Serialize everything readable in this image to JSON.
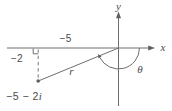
{
  "figure": {
    "axis_labels": {
      "x": "x",
      "y": "y"
    },
    "segment_labels": {
      "horizontal": "−5",
      "vertical": "−2",
      "radius": "r",
      "angle": "θ"
    },
    "point_label": {
      "main": "−5 − 2",
      "suffix": "i"
    },
    "point": {
      "real": -5,
      "imaginary": -2
    },
    "colors": {
      "line": "#6e6e6e",
      "dashed_line": "#7a7a7a",
      "text": "#4a4a4a",
      "background": "#ffffff"
    }
  }
}
